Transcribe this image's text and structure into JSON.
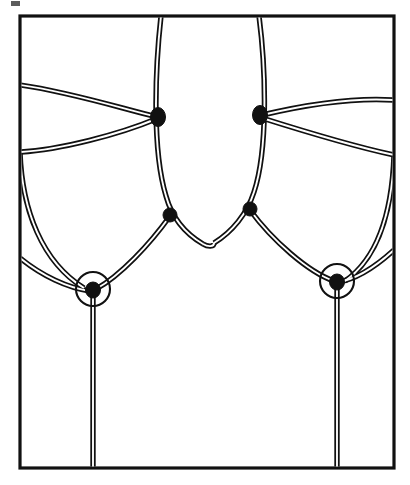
{
  "figure": {
    "caption": "",
    "background_color": "#ffffff",
    "ink_color": "#111111",
    "line_style": "double-stroke ribbon"
  },
  "frame": {
    "name": "bounding-box",
    "x": 20,
    "y": 16,
    "width": 374,
    "height": 452,
    "stroke": "#111111",
    "stroke_width": 3.2
  },
  "strands": {
    "stroke_outer": "#111111",
    "stroke_outer_width": 5.4,
    "stroke_inner": "#ffffff",
    "stroke_inner_width": 1.9,
    "paths": [
      {
        "name": "central-oval-left-branch",
        "d": "M 161 16 C 155 70, 152 150, 166 196 C 172 218, 186 234, 203 244"
      },
      {
        "name": "central-oval-right-branch",
        "d": "M 259 16 C 266 70, 268 150, 254 192 C 247 214, 232 232, 214 243"
      },
      {
        "name": "central-oval-bottom-arc",
        "d": "M 203 244 C 208 247, 214 247, 214 243"
      },
      {
        "name": "upper-left-horizontal-in",
        "d": "M 20 85 C 70 92, 120 108, 157 117"
      },
      {
        "name": "upper-right-horizontal-out",
        "d": "M 262 115 C 300 106, 348 97, 394 100"
      },
      {
        "name": "mid-left-arc-to-upper-vertex",
        "d": "M 20 152 C 60 150, 120 134, 156 119"
      },
      {
        "name": "mid-right-arc-to-upper-vertex",
        "d": "M 262 118 C 300 130, 352 146, 394 155"
      },
      {
        "name": "left-lobe-descending-arc",
        "d": "M 20 152 C 22 210, 42 262, 84 288"
      },
      {
        "name": "right-lobe-descending-arc",
        "d": "M 394 155 C 392 212, 378 258, 345 281"
      },
      {
        "name": "left-lower-edge-arc",
        "d": "M 20 258 C 42 276, 68 288, 90 291"
      },
      {
        "name": "right-lower-edge-arc",
        "d": "M 394 250 C 372 270, 352 280, 338 282"
      },
      {
        "name": "left-cusp-to-circled-crossing",
        "d": "M 170 216 C 150 244, 120 276, 96 289"
      },
      {
        "name": "right-cusp-to-circled-crossing",
        "d": "M 250 210 C 272 240, 308 272, 334 281"
      },
      {
        "name": "left-vertical-tail",
        "d": "M 93 292 L 93 468"
      },
      {
        "name": "right-vertical-tail",
        "d": "M 337 284 L 337 468"
      }
    ]
  },
  "vertices": [
    {
      "name": "upper-left-vertex",
      "cx": 158,
      "cy": 117,
      "rx": 7.5,
      "ry": 9.5,
      "type": "solid-node"
    },
    {
      "name": "upper-right-vertex",
      "cx": 260,
      "cy": 115,
      "rx": 7.5,
      "ry": 9.5,
      "type": "solid-node"
    },
    {
      "name": "mid-left-vertex",
      "cx": 170,
      "cy": 215,
      "rx": 7,
      "ry": 7,
      "type": "solid-node"
    },
    {
      "name": "mid-right-vertex",
      "cx": 250,
      "cy": 209,
      "rx": 7,
      "ry": 7,
      "type": "solid-node"
    },
    {
      "name": "lower-left-circled-vertex",
      "cx": 93,
      "cy": 290,
      "rx": 7.5,
      "ry": 8,
      "type": "solid-node"
    },
    {
      "name": "lower-right-circled-vertex",
      "cx": 337,
      "cy": 282,
      "rx": 7.5,
      "ry": 8,
      "type": "solid-node"
    }
  ],
  "crossing_circles": [
    {
      "name": "left-crossing-circle",
      "cx": 93,
      "cy": 289,
      "r": 17
    },
    {
      "name": "right-crossing-circle",
      "cx": 337,
      "cy": 281,
      "r": 17
    }
  ],
  "artifacts": [
    {
      "name": "scan-speck-top-left",
      "x": 11,
      "y": 1,
      "width": 9,
      "height": 5
    }
  ],
  "counts": {
    "solid_vertices": 6,
    "circled_crossings": 2,
    "frame_exits_top": 2,
    "frame_exits_left": 3,
    "frame_exits_right": 3,
    "frame_exits_bottom": 2
  }
}
